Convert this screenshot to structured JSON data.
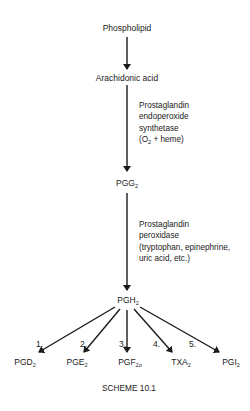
{
  "diagram": {
    "type": "biochemical-pathway",
    "caption": "SCHEME 10.1",
    "nodes": {
      "phospholipid": "Phospholipid",
      "arachidonic_acid": "Arachidonic acid",
      "pgg2": {
        "base": "PGG",
        "sub": "2"
      },
      "pgh2": {
        "base": "PGH",
        "sub": "2"
      }
    },
    "enzyme1": {
      "lines": [
        "Prostaglandin",
        "endoperoxide",
        "synthetase",
        "(O",
        "2",
        " + heme)"
      ],
      "line1": "Prostaglandin",
      "line2": "endoperoxide",
      "line3": "synthetase",
      "line4_pre": "(O",
      "line4_sub": "2",
      "line4_post": " + heme)"
    },
    "enzyme2": {
      "line1": "Prostaglandin",
      "line2": "peroxidase",
      "line3": "(tryptophan, epinephrine,",
      "line4": "uric acid, etc.)"
    },
    "products": [
      {
        "step": "1.",
        "base": "PGD",
        "sub": "2"
      },
      {
        "step": "2.",
        "base": "PGE",
        "sub": "2"
      },
      {
        "step": "3.",
        "base": "PGF",
        "sub": "2α"
      },
      {
        "step": "4.",
        "base": "TXA",
        "sub": "2"
      },
      {
        "step": "5.",
        "base": "PGI",
        "sub": "2"
      }
    ],
    "edges": [
      [
        "Phospholipid",
        "Arachidonic acid"
      ],
      [
        "Arachidonic acid",
        "PGG2"
      ],
      [
        "PGG2",
        "PGH2"
      ],
      [
        "PGH2",
        "PGD2"
      ],
      [
        "PGH2",
        "PGE2"
      ],
      [
        "PGH2",
        "PGF2α"
      ],
      [
        "PGH2",
        "TXA2"
      ],
      [
        "PGH2",
        "PGI2"
      ]
    ]
  }
}
